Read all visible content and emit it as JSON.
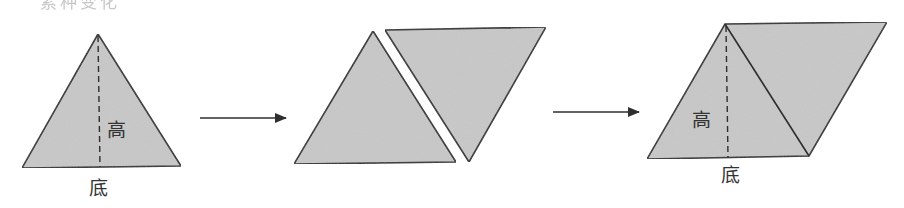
{
  "diagram": {
    "title_fragment": "素种变化",
    "fill_color": "#c8c8c8",
    "stroke_color": "#2e2e2e",
    "steps": [
      {
        "name": "triangle",
        "height_label": "高",
        "base_label": "底"
      },
      {
        "name": "two-triangles"
      },
      {
        "name": "parallelogram",
        "height_label": "高",
        "base_label": "底"
      }
    ],
    "arrows": 2
  }
}
